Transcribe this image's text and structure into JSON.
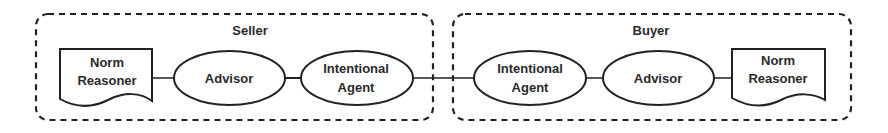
{
  "diagram": {
    "groups": [
      {
        "id": "seller",
        "label": "Seller"
      },
      {
        "id": "buyer",
        "label": "Buyer"
      }
    ],
    "seller": {
      "norm_reasoner": {
        "line1": "Norm",
        "line2": "Reasoner"
      },
      "advisor": {
        "label": "Advisor"
      },
      "intentional_agent": {
        "line1": "Intentional",
        "line2": "Agent"
      }
    },
    "buyer": {
      "intentional_agent": {
        "line1": "Intentional",
        "line2": "Agent"
      },
      "advisor": {
        "label": "Advisor"
      },
      "norm_reasoner": {
        "line1": "Norm",
        "line2": "Reasoner"
      }
    },
    "edges": [
      [
        "Seller Norm Reasoner",
        "Seller Advisor"
      ],
      [
        "Seller Advisor",
        "Seller Intentional Agent"
      ],
      [
        "Seller Intentional Agent",
        "Buyer Intentional Agent"
      ],
      [
        "Buyer Intentional Agent",
        "Buyer Advisor"
      ],
      [
        "Buyer Advisor",
        "Buyer Norm Reasoner"
      ]
    ],
    "colors": {
      "stroke": "#222222",
      "text": "#2a2a2a",
      "background": "#ffffff"
    }
  }
}
